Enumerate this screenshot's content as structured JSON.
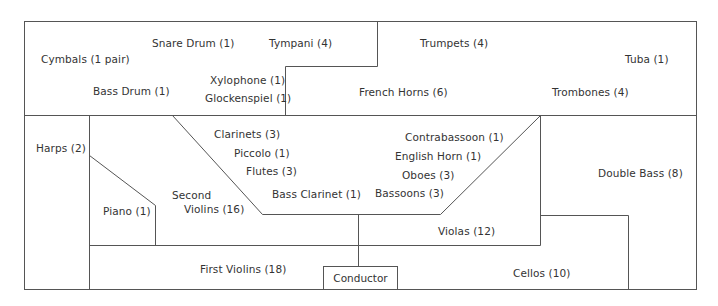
{
  "diagram": {
    "type": "orchestra-seating-chart",
    "line_color": "#555555",
    "text_color": "#333333",
    "background": "#ffffff"
  },
  "sections": {
    "percussion": {
      "snare_drum": "Snare Drum (1)",
      "tympani": "Tympani (4)",
      "cymbals": "Cymbals (1 pair)",
      "xylophone": "Xylophone (1)",
      "bass_drum": "Bass Drum (1)",
      "glockenspiel": "Glockenspiel (1)"
    },
    "brass": {
      "trumpets": "Trumpets (4)",
      "tuba": "Tuba (1)",
      "french_horns": "French Horns (6)",
      "trombones": "Trombones (4)"
    },
    "woodwinds": {
      "clarinets": "Clarinets (3)",
      "piccolo": "Piccolo (1)",
      "flutes": "Flutes (3)",
      "bass_clarinet": "Bass Clarinet (1)",
      "contrabassoon": "Contrabassoon (1)",
      "english_horn": "English Horn (1)",
      "oboes": "Oboes (3)",
      "bassoons": "Bassoons (3)"
    },
    "strings": {
      "harps": "Harps (2)",
      "piano": "Piano (1)",
      "second_violins_line1": "Second",
      "second_violins_line2": "Violins (16)",
      "first_violins": "First Violins (18)",
      "violas": "Violas (12)",
      "cellos": "Cellos (10)",
      "double_bass": "Double Bass (8)"
    },
    "conductor": "Conductor"
  }
}
